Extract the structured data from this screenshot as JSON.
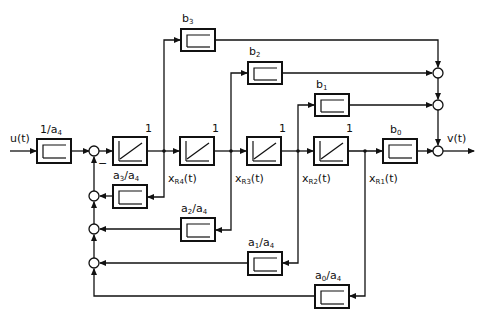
{
  "diagram": {
    "type": "state-space block diagram (observer canonical form)",
    "input": "u(t)",
    "output": "v(t)",
    "input_gain": "1/a4",
    "integrators": [
      {
        "id": "int4",
        "gain": "1",
        "state": "xR4(t)"
      },
      {
        "id": "int3",
        "gain": "1",
        "state": "xR3(t)"
      },
      {
        "id": "int2",
        "gain": "1",
        "state": "xR2(t)"
      },
      {
        "id": "int1",
        "gain": "1",
        "state": "xR1(t)"
      }
    ],
    "feedforward_gains": [
      "b3",
      "b2",
      "b1",
      "b0"
    ],
    "feedback_gains": [
      "a3/a4",
      "a2/a4",
      "a1/a4",
      "a0/a4"
    ],
    "sum_sign": "−"
  },
  "labels": {
    "u": "u(t)",
    "v": "v(t)",
    "in_gain": "1/a",
    "in_gain_sub": "4",
    "one": "1",
    "x": "x",
    "xr4_sub": "R4",
    "xr3_sub": "R3",
    "xr2_sub": "R2",
    "xr1_sub": "R1",
    "t": "(t)",
    "b": "b",
    "b3_sub": "3",
    "b2_sub": "2",
    "b1_sub": "1",
    "b0_sub": "0",
    "a": "a",
    "a3_sub": "3",
    "a2_sub": "2",
    "a1_sub": "1",
    "a0_sub": "0",
    "slash_a": "/a",
    "a4_sub": "4",
    "minus": "−"
  }
}
